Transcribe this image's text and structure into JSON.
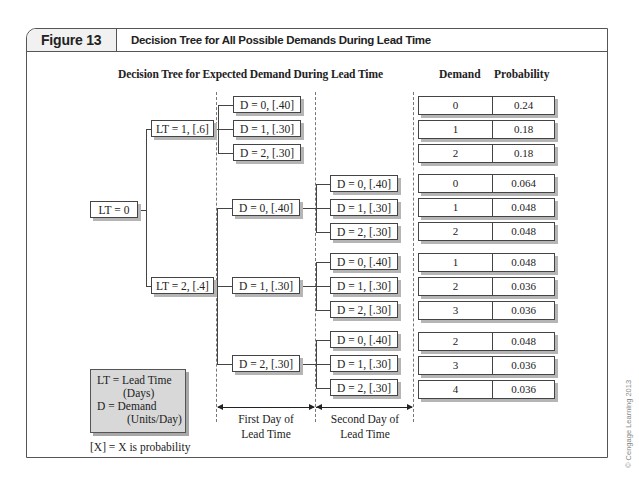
{
  "header": {
    "figure_label": "Figure 13",
    "figure_title": "Decision Tree for All Possible Demands During Lead Time"
  },
  "diagram": {
    "title": "Decision Tree for Expected Demand During Lead Time",
    "columns": {
      "demand": "Demand",
      "probability": "Probability"
    },
    "root": "LT = 0",
    "lead_time_nodes": [
      "LT = 1, [.6]",
      "LT = 2, [.4]"
    ],
    "lt1_day1": [
      "D = 0, [.40]",
      "D = 1, [.30]",
      "D = 2, [.30]"
    ],
    "lt2_day1": [
      "D = 0, [.40]",
      "D = 1, [.30]",
      "D = 2, [.30]"
    ],
    "lt2_day2": [
      [
        "D = 0, [.40]",
        "D = 1, [.30]",
        "D = 2, [.30]"
      ],
      [
        "D = 0, [.40]",
        "D = 1, [.30]",
        "D = 2, [.30]"
      ],
      [
        "D = 0, [.40]",
        "D = 1, [.30]",
        "D = 2, [.30]"
      ]
    ],
    "results": [
      {
        "demand": "0",
        "probability": "0.24"
      },
      {
        "demand": "1",
        "probability": "0.18"
      },
      {
        "demand": "2",
        "probability": "0.18"
      },
      {
        "demand": "0",
        "probability": "0.064"
      },
      {
        "demand": "1",
        "probability": "0.048"
      },
      {
        "demand": "2",
        "probability": "0.048"
      },
      {
        "demand": "1",
        "probability": "0.048"
      },
      {
        "demand": "2",
        "probability": "0.036"
      },
      {
        "demand": "3",
        "probability": "0.036"
      },
      {
        "demand": "2",
        "probability": "0.048"
      },
      {
        "demand": "3",
        "probability": "0.036"
      },
      {
        "demand": "4",
        "probability": "0.036"
      }
    ],
    "spans": {
      "first_day_line1": "First Day of",
      "first_day_line2": "Lead Time",
      "second_day_line1": "Second Day of",
      "second_day_line2": "Lead Time"
    },
    "legend": {
      "line1": "LT = Lead Time",
      "line2": "(Days)",
      "line3": "D = Demand",
      "line4": "(Units/Day)"
    },
    "note": "[X] = X is probability"
  },
  "copyright": "© Cengage Learning 2013"
}
